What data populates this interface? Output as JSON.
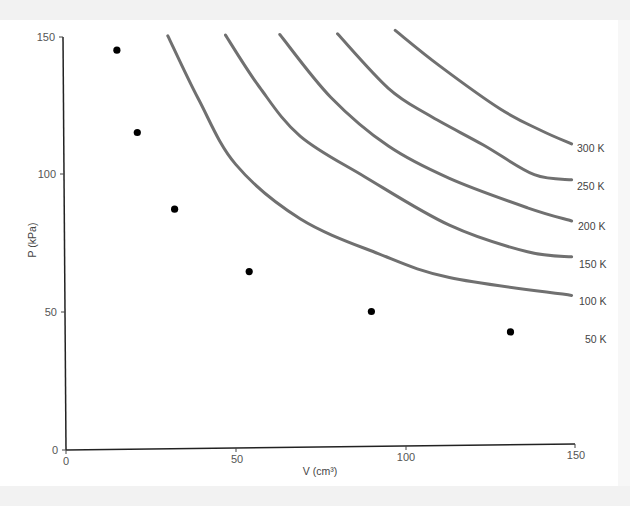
{
  "chart_data": {
    "type": "scatter",
    "title": "",
    "xlabel": "V (cm³)",
    "ylabel": "P (kPa)",
    "xlim": [
      0,
      150
    ],
    "ylim": [
      0,
      150
    ],
    "x_ticks": [
      0,
      50,
      100,
      150
    ],
    "y_ticks": [
      0,
      50,
      100,
      150
    ],
    "grid": false,
    "legend": "none; curves labeled inline at right",
    "series": [
      {
        "name": "measured points",
        "kind": "scatter",
        "color": "#000000",
        "points": [
          [
            15,
            145
          ],
          [
            21,
            115
          ],
          [
            32,
            87
          ],
          [
            54,
            64
          ],
          [
            90,
            49
          ],
          [
            131,
            41
          ]
        ]
      }
    ],
    "isotherms": [
      {
        "label": "100 K",
        "color": "#707070",
        "points": [
          [
            30,
            150
          ],
          [
            39,
            127
          ],
          [
            50,
            103
          ],
          [
            69,
            83
          ],
          [
            92,
            70
          ],
          [
            113,
            61
          ],
          [
            149,
            54
          ]
        ]
      },
      {
        "label": "150 K",
        "color": "#707070",
        "points": [
          [
            47,
            150
          ],
          [
            57,
            131
          ],
          [
            69,
            113
          ],
          [
            88,
            98
          ],
          [
            113,
            80
          ],
          [
            136,
            70
          ],
          [
            149,
            68
          ]
        ]
      },
      {
        "label": "200 K",
        "color": "#707070",
        "points": [
          [
            63,
            150
          ],
          [
            78,
            127
          ],
          [
            95,
            109
          ],
          [
            113,
            97
          ],
          [
            136,
            86
          ],
          [
            149,
            81
          ]
        ]
      },
      {
        "label": "250 K",
        "color": "#707070",
        "points": [
          [
            80,
            150
          ],
          [
            95,
            130
          ],
          [
            107,
            120
          ],
          [
            123,
            109
          ],
          [
            138,
            98
          ],
          [
            149,
            96
          ]
        ]
      },
      {
        "label": "300 K",
        "color": "#707070",
        "points": [
          [
            97,
            151
          ],
          [
            110,
            138
          ],
          [
            128,
            122
          ],
          [
            140,
            114
          ],
          [
            149,
            109
          ]
        ]
      }
    ],
    "extra_labels": [
      {
        "label": "50 K",
        "at": [
          152,
          40
        ]
      }
    ]
  },
  "axes": {
    "x_title": "V (cm³)",
    "y_title": "P (kPa)",
    "x_tick_labels": [
      "0",
      "50",
      "100",
      "150"
    ],
    "y_tick_labels": [
      "0",
      "50",
      "100",
      "150"
    ]
  },
  "curve_labels": [
    "300 K",
    "250 K",
    "200 K",
    "150 K",
    "100 K",
    "50 K"
  ]
}
